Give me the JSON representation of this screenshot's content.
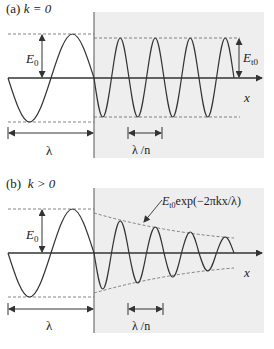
{
  "panels": [
    {
      "id": "a",
      "label_prefix": "(a)",
      "label_condition": "k = 0",
      "labels": {
        "incident_amplitude": "E",
        "incident_amplitude_sub": "0",
        "transmitted_amplitude": "E",
        "transmitted_amplitude_sub": "t0",
        "wavelength_vacuum": "λ",
        "wavelength_medium": "λ /n",
        "axis": "x"
      }
    },
    {
      "id": "b",
      "label_prefix": "(b)",
      "label_condition": "k > 0",
      "labels": {
        "incident_amplitude": "E",
        "incident_amplitude_sub": "0",
        "envelope_formula_E": "E",
        "envelope_formula_sub": "t0",
        "envelope_formula_rest": "exp(−2πkx/λ)",
        "wavelength_vacuum": "λ",
        "wavelength_medium": "λ /n",
        "axis": "x"
      }
    }
  ],
  "colors": {
    "line": "#333333",
    "medium_background": "#ececec",
    "dashed": "#555555"
  }
}
